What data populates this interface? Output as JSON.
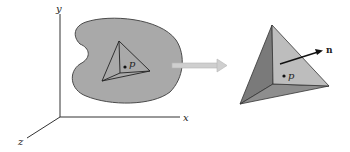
{
  "diagram": {
    "axes": {
      "x_label": "x",
      "y_label": "y",
      "z_label": "z"
    },
    "body": {
      "point_label": "p",
      "fill_color": "#a9a9a9",
      "outline_color": "#4a4a4a"
    },
    "transition_arrow": {
      "color": "#c8c8c8"
    },
    "enlarged_tetrahedron": {
      "point_label": "p",
      "normal_label": "n",
      "front_face_color": "#bdbdbd",
      "side_face_color": "#7a7a7a",
      "bottom_face_color": "#8e8e8e"
    }
  }
}
